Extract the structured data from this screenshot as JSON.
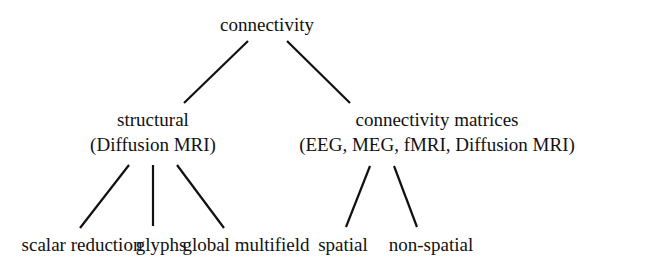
{
  "diagram": {
    "type": "tree",
    "root": {
      "label": "connectivity",
      "children": [
        {
          "label": "structural",
          "sublabel": "(Diffusion MRI)",
          "children": [
            {
              "label": "scalar reduction"
            },
            {
              "label": "glyphs"
            },
            {
              "label": "global multifield"
            }
          ]
        },
        {
          "label": "connectivity matrices",
          "sublabel": "(EEG, MEG, fMRI, Diffusion MRI)",
          "children": [
            {
              "label": "spatial"
            },
            {
              "label": "non-spatial"
            }
          ]
        }
      ]
    },
    "colors": {
      "text": "#111111",
      "edge": "#111111",
      "background": "#ffffff"
    }
  }
}
